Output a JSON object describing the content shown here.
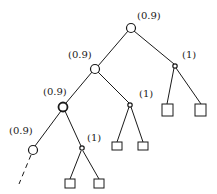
{
  "diagram": {
    "type": "game-tree",
    "labels": {
      "root": "(0.9)",
      "level1_left": "(0.9)",
      "level1_right": "(1)",
      "level2_left": "(0.9)",
      "level2_right": "(1)",
      "level3_left": "(0.9)",
      "level3_right": "(1)"
    },
    "nodes": [
      {
        "id": "n0",
        "kind": "circle",
        "label": "(0.9)"
      },
      {
        "id": "n1",
        "kind": "circle",
        "label": "(0.9)"
      },
      {
        "id": "n2",
        "kind": "small-circle",
        "label": "(1)"
      },
      {
        "id": "n3",
        "kind": "circle",
        "label": "(0.9)"
      },
      {
        "id": "n4",
        "kind": "small-circle",
        "label": "(1)"
      },
      {
        "id": "n5",
        "kind": "circle",
        "label": "(0.9)"
      },
      {
        "id": "n6",
        "kind": "small-circle",
        "label": "(1)"
      }
    ],
    "leaves": [
      {
        "parent": "n2",
        "kind": "square"
      },
      {
        "parent": "n2",
        "kind": "square"
      },
      {
        "parent": "n4",
        "kind": "square"
      },
      {
        "parent": "n4",
        "kind": "square"
      },
      {
        "parent": "n6",
        "kind": "square"
      },
      {
        "parent": "n6",
        "kind": "square"
      }
    ],
    "continuation": "dashed-edge"
  }
}
